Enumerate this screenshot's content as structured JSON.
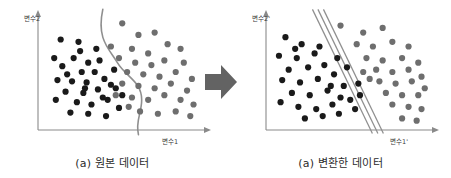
{
  "figure": {
    "background": "#ffffff",
    "arrow": {
      "icon": "right-arrow-icon",
      "color": "#636363",
      "direction": "right"
    }
  },
  "panels": [
    {
      "id": "original",
      "caption": "(a) 원본 데이터",
      "y_axis_label": "변수2",
      "x_axis_label": "변수1",
      "boundary_type": "curve",
      "boundary_label": "S-shaped nonlinear decision boundary"
    },
    {
      "id": "transformed",
      "caption": "(a) 변환한 데이터",
      "y_axis_label": "변수2'",
      "x_axis_label": "변수1'",
      "boundary_type": "lines",
      "boundary_label": "Three parallel straight margin lines"
    }
  ],
  "chart_data": [
    {
      "type": "scatter",
      "title": "(a) 원본 데이터",
      "xlabel": "변수1",
      "ylabel": "변수2",
      "xlim": [
        0,
        100
      ],
      "ylim": [
        0,
        100
      ],
      "grid": false,
      "legend": "none",
      "axis_color": "#8a8a8a",
      "series": [
        {
          "name": "class-a-dark",
          "color": "#1a1a1a",
          "marker": "circle",
          "points": [
            [
              14,
              78
            ],
            [
              25,
              76
            ],
            [
              10,
              62
            ],
            [
              22,
              62
            ],
            [
              31,
              58
            ],
            [
              18,
              48
            ],
            [
              27,
              50
            ],
            [
              35,
              50
            ],
            [
              12,
              43
            ],
            [
              21,
              42
            ],
            [
              30,
              41
            ],
            [
              41,
              44
            ],
            [
              17,
              33
            ],
            [
              28,
              32
            ],
            [
              37,
              35
            ],
            [
              45,
              39
            ],
            [
              11,
              26
            ],
            [
              24,
              24
            ],
            [
              33,
              22
            ],
            [
              43,
              26
            ],
            [
              52,
              30
            ],
            [
              20,
              15
            ],
            [
              31,
              14
            ],
            [
              42,
              12
            ],
            [
              50,
              19
            ],
            [
              38,
              60
            ],
            [
              47,
              52
            ],
            [
              36,
              70
            ],
            [
              29,
              36
            ],
            [
              15,
              55
            ],
            [
              48,
              36
            ],
            [
              40,
              28
            ],
            [
              26,
              68
            ]
          ]
        },
        {
          "name": "class-b-gray",
          "color": "#6e6e6e",
          "marker": "circle",
          "points": [
            [
              52,
              92
            ],
            [
              62,
              82
            ],
            [
              72,
              84
            ],
            [
              45,
              72
            ],
            [
              58,
              70
            ],
            [
              68,
              66
            ],
            [
              80,
              74
            ],
            [
              88,
              70
            ],
            [
              50,
              62
            ],
            [
              60,
              58
            ],
            [
              70,
              56
            ],
            [
              78,
              60
            ],
            [
              90,
              58
            ],
            [
              55,
              50
            ],
            [
              65,
              48
            ],
            [
              75,
              46
            ],
            [
              85,
              50
            ],
            [
              95,
              44
            ],
            [
              52,
              40
            ],
            [
              62,
              38
            ],
            [
              72,
              36
            ],
            [
              82,
              40
            ],
            [
              92,
              34
            ],
            [
              58,
              28
            ],
            [
              68,
              26
            ],
            [
              78,
              30
            ],
            [
              88,
              26
            ],
            [
              96,
              22
            ],
            [
              63,
              16
            ],
            [
              74,
              14
            ],
            [
              85,
              16
            ],
            [
              94,
              12
            ],
            [
              48,
              30
            ],
            [
              56,
              20
            ]
          ]
        }
      ],
      "annotations": [
        {
          "name": "decision-boundary",
          "shape": "sigmoid-curve",
          "color": "#8f8f8f"
        }
      ]
    },
    {
      "type": "scatter",
      "title": "(a) 변환한 데이터",
      "xlabel": "변수1'",
      "ylabel": "변수2'",
      "xlim": [
        0,
        100
      ],
      "ylim": [
        0,
        100
      ],
      "grid": false,
      "legend": "none",
      "axis_color": "#8a8a8a",
      "series": [
        {
          "name": "class-a-dark",
          "color": "#1a1a1a",
          "marker": "circle",
          "points": [
            [
              12,
              80
            ],
            [
              22,
              74
            ],
            [
              8,
              64
            ],
            [
              19,
              62
            ],
            [
              30,
              66
            ],
            [
              14,
              52
            ],
            [
              26,
              54
            ],
            [
              36,
              56
            ],
            [
              10,
              43
            ],
            [
              21,
              41
            ],
            [
              32,
              44
            ],
            [
              42,
              48
            ],
            [
              16,
              32
            ],
            [
              27,
              30
            ],
            [
              38,
              34
            ],
            [
              48,
              38
            ],
            [
              9,
              24
            ],
            [
              20,
              20
            ],
            [
              31,
              18
            ],
            [
              41,
              22
            ],
            [
              52,
              26
            ],
            [
              24,
              10
            ],
            [
              35,
              12
            ],
            [
              45,
              14
            ],
            [
              55,
              18
            ],
            [
              44,
              62
            ],
            [
              50,
              54
            ],
            [
              33,
              72
            ],
            [
              57,
              40
            ],
            [
              18,
              70
            ],
            [
              58,
              30
            ],
            [
              46,
              28
            ],
            [
              40,
              38
            ]
          ]
        },
        {
          "name": "class-b-gray",
          "color": "#6e6e6e",
          "marker": "circle",
          "points": [
            [
              46,
              90
            ],
            [
              60,
              84
            ],
            [
              72,
              88
            ],
            [
              56,
              74
            ],
            [
              66,
              72
            ],
            [
              78,
              76
            ],
            [
              88,
              72
            ],
            [
              62,
              62
            ],
            [
              72,
              60
            ],
            [
              84,
              62
            ],
            [
              94,
              58
            ],
            [
              68,
              52
            ],
            [
              78,
              50
            ],
            [
              88,
              52
            ],
            [
              96,
              46
            ],
            [
              70,
              42
            ],
            [
              80,
              40
            ],
            [
              90,
              42
            ],
            [
              98,
              36
            ],
            [
              74,
              32
            ],
            [
              84,
              30
            ],
            [
              94,
              30
            ],
            [
              78,
              22
            ],
            [
              88,
              20
            ],
            [
              96,
              18
            ],
            [
              84,
              10
            ],
            [
              93,
              8
            ],
            [
              60,
              50
            ],
            [
              64,
              44
            ]
          ]
        }
      ],
      "annotations": [
        {
          "name": "margin-line-upper",
          "shape": "line",
          "color": "#8f8f8f"
        },
        {
          "name": "decision-line-center",
          "shape": "line",
          "color": "#8f8f8f"
        },
        {
          "name": "margin-line-lower",
          "shape": "line",
          "color": "#8f8f8f"
        }
      ]
    }
  ]
}
